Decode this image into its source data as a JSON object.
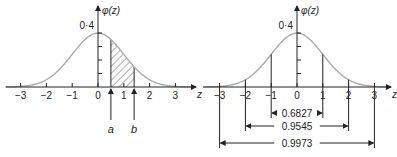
{
  "chart_data": [
    {
      "type": "line",
      "title": "",
      "description": "Standard normal density with shaded area between a and b",
      "xlabel": "z",
      "ylabel": "φ(z)",
      "xlim": [
        -3.5,
        3.5
      ],
      "ylim": [
        0,
        0.4
      ],
      "x_ticks": [
        -3,
        -2,
        -1,
        0,
        1,
        2,
        3
      ],
      "x_tick_labels": [
        "−3",
        "−2",
        "−1",
        "0",
        "1",
        "2",
        "3"
      ],
      "y_ticks": [
        0.1,
        0.2,
        0.3,
        0.4
      ],
      "y_tick_label": "0·4",
      "shaded_region": {
        "from": 0.5,
        "to": 1.4,
        "pattern": "hatched"
      },
      "annotations": [
        {
          "label": "a",
          "x": 0.5
        },
        {
          "label": "b",
          "x": 1.4
        }
      ],
      "curve_color": "#aaaaaa"
    },
    {
      "type": "line",
      "title": "",
      "description": "Standard normal density with probability intervals",
      "xlabel": "z",
      "ylabel": "φ(z)",
      "xlim": [
        -3.5,
        3.5
      ],
      "ylim": [
        0,
        0.4
      ],
      "x_ticks": [
        -3,
        -2,
        -1,
        0,
        1,
        2,
        3
      ],
      "x_tick_labels": [
        "−3",
        "−2",
        "−1",
        "0",
        "1",
        "2",
        "3"
      ],
      "y_ticks": [
        0.1,
        0.2,
        0.3,
        0.4
      ],
      "y_tick_label": "0·4",
      "intervals": [
        {
          "from": -1,
          "to": 1,
          "label": "0.6827"
        },
        {
          "from": -2,
          "to": 2,
          "label": "0.9545"
        },
        {
          "from": -3,
          "to": 3,
          "label": "0.9973"
        }
      ],
      "curve_color": "#aaaaaa"
    }
  ]
}
